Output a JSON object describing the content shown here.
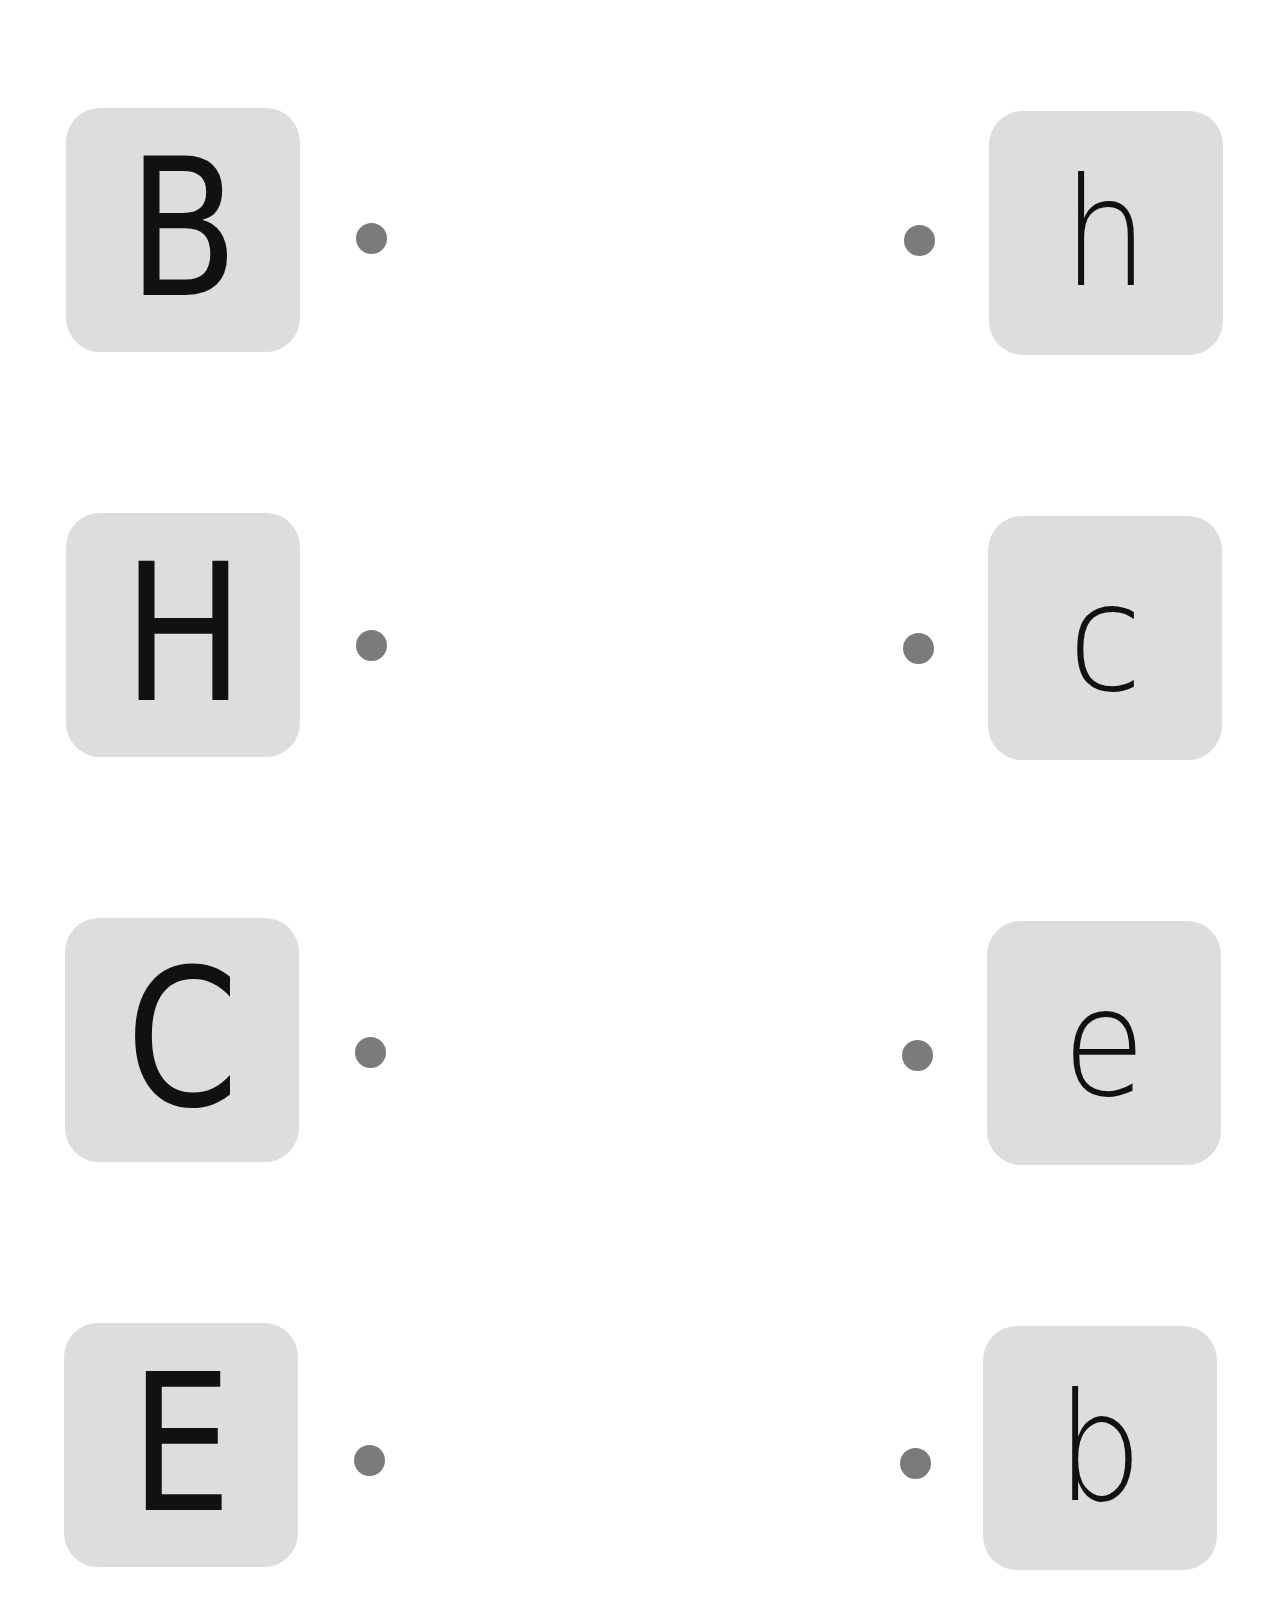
{
  "colors": {
    "card_background": "#dddddd",
    "dot": "#7b7b7b",
    "letter": "#111111",
    "page_background": "#ffffff"
  },
  "left_column": [
    {
      "letter": "B",
      "card": {
        "x": 66,
        "y": 108
      },
      "dot": {
        "x": 356,
        "y": 223
      }
    },
    {
      "letter": "H",
      "card": {
        "x": 66,
        "y": 513
      },
      "dot": {
        "x": 356,
        "y": 630
      }
    },
    {
      "letter": "C",
      "card": {
        "x": 65,
        "y": 918
      },
      "dot": {
        "x": 355,
        "y": 1037
      }
    },
    {
      "letter": "E",
      "card": {
        "x": 64,
        "y": 1323
      },
      "dot": {
        "x": 354,
        "y": 1445
      }
    }
  ],
  "right_column": [
    {
      "letter": "h",
      "card": {
        "x": 989,
        "y": 111
      },
      "dot": {
        "x": 904,
        "y": 225
      }
    },
    {
      "letter": "c",
      "card": {
        "x": 988,
        "y": 516
      },
      "dot": {
        "x": 903,
        "y": 633
      }
    },
    {
      "letter": "e",
      "card": {
        "x": 987,
        "y": 921
      },
      "dot": {
        "x": 902,
        "y": 1040
      }
    },
    {
      "letter": "b",
      "card": {
        "x": 983,
        "y": 1326
      },
      "dot": {
        "x": 900,
        "y": 1448
      }
    }
  ]
}
